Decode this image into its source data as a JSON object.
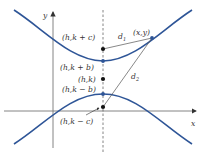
{
  "diagram": {
    "type": "hyperbola-vertical-transverse-axis",
    "colors": {
      "curve": "#2e5597",
      "axis": "#555555",
      "point": "#111111",
      "vertex": "#2e5597",
      "line": "#555555",
      "background": "#ffffff"
    },
    "axes": {
      "x_label": "x",
      "y_label": "y"
    },
    "points": {
      "focus_upper": "(h,k + c)",
      "vertex_upper": "(h,k + b)",
      "center": "(h,k)",
      "vertex_lower": "(h,k − b)",
      "focus_lower": "(h,k − c)",
      "point_on_curve": "(x,y)"
    },
    "distances": {
      "d1": "d",
      "d1_sub": "1",
      "d2": "d",
      "d2_sub": "2"
    }
  }
}
